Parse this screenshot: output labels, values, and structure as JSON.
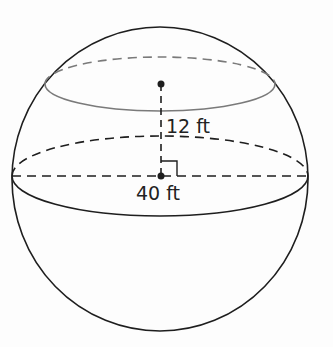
{
  "figure": {
    "type": "sphere-with-cross-section",
    "labels": {
      "height": "12 ft",
      "diameter": "40 ft"
    },
    "colors": {
      "stroke": "#1e1e1e",
      "cross_section": "#7a7a7a",
      "background": "#fdfdfd"
    }
  }
}
